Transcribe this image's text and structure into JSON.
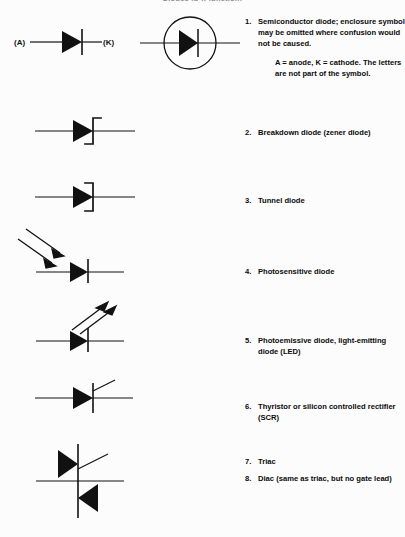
{
  "page": {
    "heading": "Diodes (p-n-junction)",
    "background_color": "#fcfcfc",
    "ink_color": "#0b0b0b"
  },
  "leads": {
    "anode_label": "(A)",
    "cathode_label": "(K)"
  },
  "symbols": [
    {
      "id": "semiconductor-diode",
      "name": "diode-symbol"
    },
    {
      "id": "enclosed-diode",
      "name": "enclosed-diode-symbol"
    },
    {
      "id": "zener-diode",
      "name": "zener-diode-symbol"
    },
    {
      "id": "tunnel-diode",
      "name": "tunnel-diode-symbol"
    },
    {
      "id": "photosensitive-diode",
      "name": "photosensitive-diode-symbol"
    },
    {
      "id": "led",
      "name": "led-symbol"
    },
    {
      "id": "scr",
      "name": "scr-symbol"
    },
    {
      "id": "triac",
      "name": "triac-symbol"
    }
  ],
  "items": [
    {
      "number": "1.",
      "text": "Semiconductor diode; enclosure symbol may be omitted where confusion would not be caused.",
      "subtext": "A = anode, K = cathode. The letters are not part of the symbol."
    },
    {
      "number": "2.",
      "text": "Breakdown diode (zener diode)",
      "subtext": ""
    },
    {
      "number": "3.",
      "text": "Tunnel diode",
      "subtext": ""
    },
    {
      "number": "4.",
      "text": "Photosensitive diode",
      "subtext": ""
    },
    {
      "number": "5.",
      "text": "Photoemissive diode, light-emitting diode (LED)",
      "subtext": ""
    },
    {
      "number": "6.",
      "text": "Thyristor or silicon controlled rectifier (SCR)",
      "subtext": ""
    },
    {
      "number": "7.",
      "text": "Triac",
      "subtext": ""
    },
    {
      "number": "8.",
      "text": "Diac (same as triac, but no gate lead)",
      "subtext": ""
    }
  ]
}
